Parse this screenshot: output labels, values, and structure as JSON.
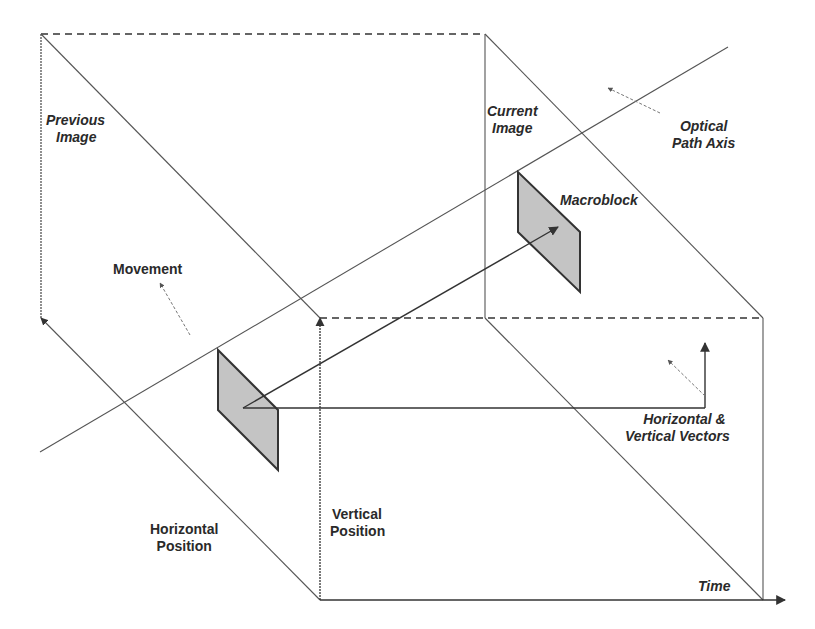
{
  "diagram": {
    "colors": {
      "line": "#555555",
      "dark_line": "#333333",
      "macroblock_fill": "#c4c4c4",
      "macroblock_edge": "#333333",
      "background": "#ffffff"
    },
    "labels": {
      "previous_image": [
        "Previous",
        "Image"
      ],
      "current_image": [
        "Current",
        "Image"
      ],
      "optical_path_axis": [
        "Optical",
        "Path Axis"
      ],
      "macroblock": [
        "Macroblock"
      ],
      "movement": [
        "Movement"
      ],
      "horizontal_vertical_vectors": [
        "Horizontal &",
        "Vertical Vectors"
      ],
      "horizontal_position": [
        "Horizontal",
        "Position"
      ],
      "vertical_position": [
        "Vertical",
        "Position"
      ],
      "time": [
        "Time"
      ]
    },
    "geometry": {
      "dashed_lines": [
        [
          41,
          34,
          485,
          34
        ],
        [
          320,
          318,
          763,
          318
        ]
      ],
      "solid_lines": [
        [
          41,
          34,
          41,
          318
        ],
        [
          41,
          34,
          320,
          318
        ],
        [
          485,
          34,
          485,
          318
        ],
        [
          485,
          34,
          763,
          318
        ],
        [
          41,
          318,
          320,
          600
        ],
        [
          485,
          318,
          763,
          600
        ],
        [
          763,
          318,
          763,
          600
        ],
        [
          320,
          600,
          320,
          318
        ],
        [
          320,
          600,
          785,
          600
        ],
        [
          40,
          452,
          728,
          47
        ]
      ],
      "macroblocks": [
        [
          [
            218,
            350
          ],
          [
            218,
            410
          ],
          [
            278,
            470
          ],
          [
            278,
            410
          ]
        ],
        [
          [
            518,
            172
          ],
          [
            518,
            232
          ],
          [
            580,
            292
          ],
          [
            580,
            232
          ]
        ]
      ],
      "vectors": [
        [
          243,
          408,
          558,
          227
        ],
        [
          243,
          408,
          705,
          408
        ],
        [
          705,
          408,
          705,
          343
        ]
      ],
      "pointers": [
        [
          660,
          113,
          608,
          88
        ],
        [
          190,
          335,
          160,
          283
        ],
        [
          705,
          396,
          668,
          360
        ]
      ]
    }
  }
}
